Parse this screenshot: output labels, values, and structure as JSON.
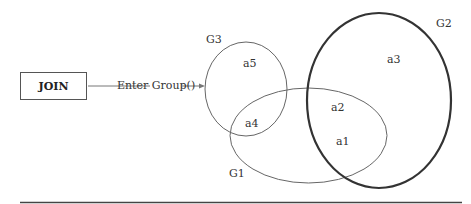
{
  "join_box": {
    "label": "JOIN"
  },
  "arrow": {
    "label": "Enter Group()"
  },
  "groups": [
    {
      "id": "G1",
      "label": "G1",
      "elements": [
        "a1",
        "a2",
        "a4"
      ]
    },
    {
      "id": "G2",
      "label": "G2",
      "elements": [
        "a1",
        "a2",
        "a3"
      ]
    },
    {
      "id": "G3",
      "label": "G3",
      "elements": [
        "a4",
        "a5"
      ]
    }
  ],
  "elements": {
    "a1": "a1",
    "a2": "a2",
    "a3": "a3",
    "a4": "a4",
    "a5": "a5"
  },
  "colors": {
    "stroke": "#555555",
    "g2_stroke": "#333333"
  }
}
